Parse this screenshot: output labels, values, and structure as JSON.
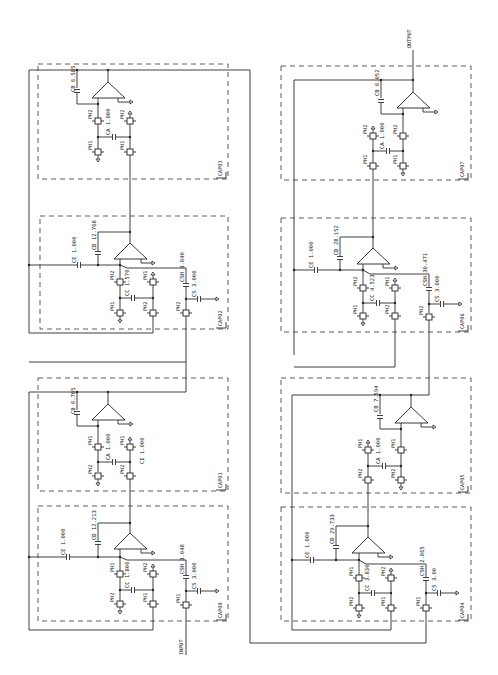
{
  "diagram": {
    "orientation": "rotated 90 degrees counter-clockwise",
    "terminals": {
      "input": "INPUT",
      "output": "OUTPUT"
    },
    "stages": [
      {
        "id": "CAP00",
        "type": "integrator-input",
        "labels": {
          "CE": "CE 1.000",
          "CD": "CD 12.213",
          "CC": "CC 1.806",
          "CSH": "CSH 3.048",
          "CS": "CS 3.000"
        },
        "switches": [
          "PH1",
          "PH2",
          "PH2",
          "PH1",
          "PH1"
        ]
      },
      {
        "id": "CAP01",
        "type": "integrator",
        "labels": {
          "CB": "CB 6.705",
          "CA": "CA 1.000",
          "CI": "CI 1.000"
        },
        "switches": [
          "PH1",
          "PH1",
          "PH2",
          "PH2"
        ]
      },
      {
        "id": "CAP02",
        "type": "integrator-input",
        "labels": {
          "CE": "CE 1.000",
          "CD": "CD 12.768",
          "CC": "CC 1.570",
          "CSH": "CSH 3.840",
          "CS": "CS 3.000"
        },
        "switches": [
          "PH2",
          "PH1",
          "PH1",
          "PH2",
          "PH2"
        ]
      },
      {
        "id": "CAP03",
        "type": "integrator",
        "labels": {
          "CB": "CB 6.585",
          "CA": "CA 1.000"
        },
        "switches": [
          "PH2",
          "PH2",
          "PH1",
          "PH1"
        ]
      },
      {
        "id": "CAP04",
        "type": "integrator-input",
        "labels": {
          "CE": "CE 1.000",
          "CD": "CD 29.733",
          "CC": "CC 3.830",
          "CSH": "CSH 2.865",
          "CS": "CS 3.00"
        },
        "switches": [
          "PH1",
          "PH2",
          "PH2",
          "PH1",
          "PH1"
        ]
      },
      {
        "id": "CAP05",
        "type": "integrator",
        "labels": {
          "CB": "CB 7.594",
          "CA": "CA 1.000"
        },
        "switches": [
          "PH1",
          "PH1",
          "PH2",
          "PH2"
        ]
      },
      {
        "id": "CAP06",
        "type": "integrator-input",
        "labels": {
          "CE": "CE 1.000",
          "CD": "CD 28.152",
          "CC": "CC 4.523",
          "CSH": "CSH 30.471",
          "CS": "CS 3.000"
        },
        "switches": [
          "PH2",
          "PH1",
          "PH1",
          "PH2",
          "PH2"
        ]
      },
      {
        "id": "CAP07",
        "type": "integrator",
        "labels": {
          "CB": "CB 6.052",
          "CA": "CA 1.000"
        },
        "switches": [
          "PH2",
          "PH2",
          "PH1",
          "PH1"
        ]
      }
    ]
  }
}
